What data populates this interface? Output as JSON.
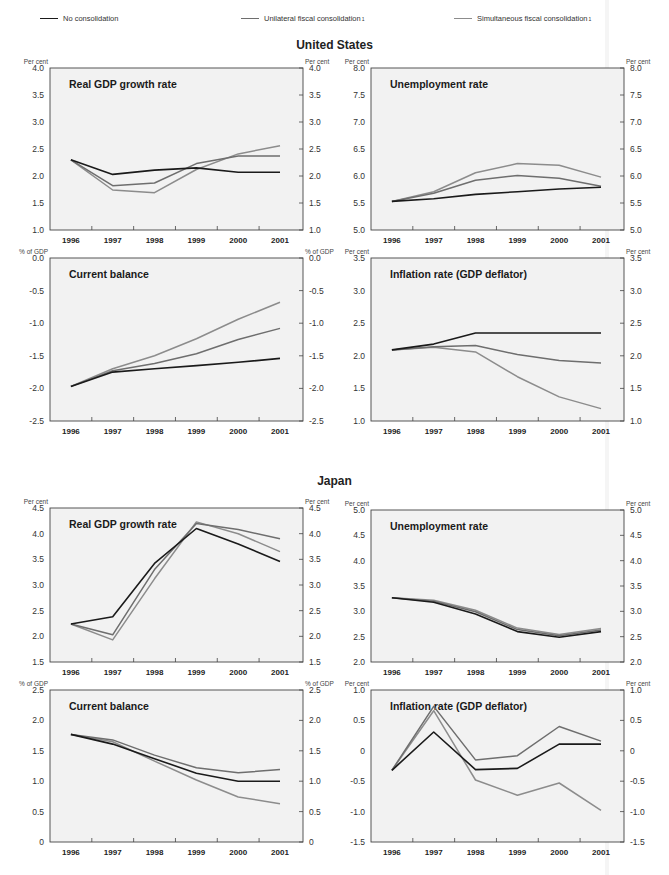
{
  "legend": {
    "items": [
      {
        "label": "No consolidation",
        "note": "",
        "color": "#1a1a1a"
      },
      {
        "label": "Unilateral fiscal consolidation",
        "note": "1",
        "color": "#6e6e6e"
      },
      {
        "label": "Simultaneous fiscal consolidation",
        "note": "1",
        "color": "#8c8c8c"
      }
    ]
  },
  "sections": [
    {
      "title": "United States"
    },
    {
      "title": "Japan"
    }
  ],
  "colors": {
    "plot_background": "#f2f2f2",
    "axis": "#444444",
    "no_consolidation": "#1a1a1a",
    "unilateral": "#6e6e6e",
    "simultaneous": "#8c8c8c"
  },
  "chart_data": [
    {
      "id": "us-gdp",
      "section": "United States",
      "type": "line",
      "title": "Real GDP growth rate",
      "ylabel_left": "Per cent",
      "ylabel_right": "Per cent",
      "categories": [
        "1996",
        "1997",
        "1998",
        "1999",
        "2000",
        "2001"
      ],
      "ylim": [
        1.0,
        4.0
      ],
      "yticks": [
        "1.0",
        "1.5",
        "2.0",
        "2.5",
        "3.0",
        "3.5",
        "4.0"
      ],
      "ytick_values": [
        1.0,
        1.5,
        2.0,
        2.5,
        3.0,
        3.5,
        4.0
      ],
      "grid": false,
      "series": [
        {
          "name": "No consolidation",
          "values": [
            2.3,
            2.03,
            2.11,
            2.15,
            2.07,
            2.07
          ]
        },
        {
          "name": "Unilateral fiscal consolidation",
          "values": [
            2.3,
            1.82,
            1.87,
            2.23,
            2.37,
            2.37
          ]
        },
        {
          "name": "Simultaneous fiscal consolidation",
          "values": [
            2.3,
            1.74,
            1.69,
            2.12,
            2.41,
            2.56
          ]
        }
      ]
    },
    {
      "id": "us-unemployment",
      "section": "United States",
      "type": "line",
      "title": "Unemployment rate",
      "ylabel_left": "Per cent",
      "ylabel_right": "Per cent",
      "categories": [
        "1996",
        "1997",
        "1998",
        "1999",
        "2000",
        "2001"
      ],
      "ylim": [
        5.0,
        8.0
      ],
      "yticks": [
        "5.0",
        "5.5",
        "6.0",
        "6.5",
        "7.0",
        "7.5",
        "8.0"
      ],
      "ytick_values": [
        5.0,
        5.5,
        6.0,
        6.5,
        7.0,
        7.5,
        8.0
      ],
      "grid": false,
      "series": [
        {
          "name": "No consolidation",
          "values": [
            5.53,
            5.58,
            5.66,
            5.71,
            5.76,
            5.79
          ]
        },
        {
          "name": "Unilateral fiscal consolidation",
          "values": [
            5.53,
            5.68,
            5.92,
            6.01,
            5.96,
            5.81
          ]
        },
        {
          "name": "Simultaneous fiscal consolidation",
          "values": [
            5.53,
            5.71,
            6.06,
            6.23,
            6.2,
            5.98
          ]
        }
      ]
    },
    {
      "id": "us-current-balance",
      "section": "United States",
      "type": "line",
      "title": "Current balance",
      "ylabel_left": "% of GDP",
      "ylabel_right": "% of GDP",
      "categories": [
        "1996",
        "1997",
        "1998",
        "1999",
        "2000",
        "2001"
      ],
      "ylim": [
        -2.5,
        0.0
      ],
      "yticks": [
        "-2.5",
        "-2.0",
        "-1.5",
        "-1.0",
        "-0.5",
        "0.0"
      ],
      "ytick_values": [
        -2.5,
        -2.0,
        -1.5,
        -1.0,
        -0.5,
        0.0
      ],
      "grid": false,
      "series": [
        {
          "name": "No consolidation",
          "values": [
            -1.97,
            -1.75,
            -1.7,
            -1.65,
            -1.6,
            -1.54
          ]
        },
        {
          "name": "Unilateral fiscal consolidation",
          "values": [
            -1.97,
            -1.73,
            -1.62,
            -1.47,
            -1.25,
            -1.08
          ]
        },
        {
          "name": "Simultaneous fiscal consolidation",
          "values": [
            -1.97,
            -1.7,
            -1.5,
            -1.24,
            -0.94,
            -0.68
          ]
        }
      ]
    },
    {
      "id": "us-inflation",
      "section": "United States",
      "type": "line",
      "title": "Inflation rate (GDP deflator)",
      "ylabel_left": "Per cent",
      "ylabel_right": "Per cent",
      "categories": [
        "1996",
        "1997",
        "1998",
        "1999",
        "2000",
        "2001"
      ],
      "ylim": [
        1.0,
        3.5
      ],
      "yticks": [
        "1.0",
        "1.5",
        "2.0",
        "2.5",
        "3.0",
        "3.5"
      ],
      "ytick_values": [
        1.0,
        1.5,
        2.0,
        2.5,
        3.0,
        3.5
      ],
      "grid": false,
      "series": [
        {
          "name": "No consolidation",
          "values": [
            2.09,
            2.18,
            2.35,
            2.35,
            2.35,
            2.35
          ]
        },
        {
          "name": "Unilateral fiscal consolidation",
          "values": [
            2.09,
            2.14,
            2.16,
            2.02,
            1.93,
            1.89
          ]
        },
        {
          "name": "Simultaneous fiscal consolidation",
          "values": [
            2.09,
            2.13,
            2.06,
            1.68,
            1.37,
            1.19
          ]
        }
      ]
    },
    {
      "id": "jp-gdp",
      "section": "Japan",
      "type": "line",
      "title": "Real GDP growth rate",
      "ylabel_left": "Per cent",
      "ylabel_right": "Per cent",
      "categories": [
        "1996",
        "1997",
        "1998",
        "1999",
        "2000",
        "2001"
      ],
      "ylim": [
        1.5,
        4.5
      ],
      "yticks": [
        "1.5",
        "2.0",
        "2.5",
        "3.0",
        "3.5",
        "4.0",
        "4.5"
      ],
      "ytick_values": [
        1.5,
        2.0,
        2.5,
        3.0,
        3.5,
        4.0,
        4.5
      ],
      "grid": false,
      "series": [
        {
          "name": "No consolidation",
          "values": [
            2.24,
            2.38,
            3.42,
            4.1,
            3.8,
            3.46
          ]
        },
        {
          "name": "Unilateral fiscal consolidation",
          "values": [
            2.24,
            2.03,
            3.3,
            4.2,
            4.08,
            3.9
          ]
        },
        {
          "name": "Simultaneous fiscal consolidation",
          "values": [
            2.24,
            1.93,
            3.12,
            4.23,
            4.0,
            3.65
          ]
        }
      ]
    },
    {
      "id": "jp-unemployment",
      "section": "Japan",
      "type": "line",
      "title": "Unemployment rate",
      "ylabel_left": "Per cent",
      "ylabel_right": "Per cent",
      "categories": [
        "1996",
        "1997",
        "1998",
        "1999",
        "2000",
        "2001"
      ],
      "ylim": [
        2.0,
        5.0
      ],
      "yticks": [
        "2.0",
        "2.5",
        "3.0",
        "3.5",
        "4.0",
        "4.5",
        "5.0"
      ],
      "ytick_values": [
        2.0,
        2.5,
        3.0,
        3.5,
        4.0,
        4.5,
        5.0
      ],
      "grid": false,
      "series": [
        {
          "name": "No consolidation",
          "values": [
            3.27,
            3.18,
            2.95,
            2.6,
            2.49,
            2.6
          ]
        },
        {
          "name": "Unilateral fiscal consolidation",
          "values": [
            3.27,
            3.2,
            2.99,
            2.64,
            2.52,
            2.63
          ]
        },
        {
          "name": "Simultaneous fiscal consolidation",
          "values": [
            3.27,
            3.22,
            3.02,
            2.67,
            2.54,
            2.66
          ]
        }
      ]
    },
    {
      "id": "jp-current-balance",
      "section": "Japan",
      "type": "line",
      "title": "Current balance",
      "ylabel_left": "% of GDP",
      "ylabel_right": "% of GDP",
      "categories": [
        "1996",
        "1997",
        "1998",
        "1999",
        "2000",
        "2001"
      ],
      "ylim": [
        0,
        2.5
      ],
      "yticks": [
        "0",
        "0.5",
        "1.0",
        "1.5",
        "2.0",
        "2.5"
      ],
      "ytick_values": [
        0,
        0.5,
        1.0,
        1.5,
        2.0,
        2.5
      ],
      "grid": false,
      "series": [
        {
          "name": "No consolidation",
          "values": [
            1.77,
            1.61,
            1.37,
            1.13,
            1.0,
            1.0
          ]
        },
        {
          "name": "Unilateral fiscal consolidation",
          "values": [
            1.77,
            1.68,
            1.43,
            1.22,
            1.14,
            1.19
          ]
        },
        {
          "name": "Simultaneous fiscal consolidation",
          "values": [
            1.77,
            1.65,
            1.33,
            1.02,
            0.74,
            0.63
          ]
        }
      ]
    },
    {
      "id": "jp-inflation",
      "section": "Japan",
      "type": "line",
      "title": "Inflation rate (GDP deflator)",
      "ylabel_left": "Per cent",
      "ylabel_right": "Per cent",
      "categories": [
        "1996",
        "1997",
        "1998",
        "1999",
        "2000",
        "2001"
      ],
      "ylim": [
        -1.5,
        1.0
      ],
      "yticks": [
        "-1.5",
        "-1.0",
        "-0.5",
        "0",
        "0.5",
        "1.0"
      ],
      "ytick_values": [
        -1.5,
        -1.0,
        -0.5,
        0,
        0.5,
        1.0
      ],
      "grid": false,
      "series": [
        {
          "name": "No consolidation",
          "values": [
            -0.32,
            0.31,
            -0.31,
            -0.29,
            0.11,
            0.11
          ]
        },
        {
          "name": "Unilateral fiscal consolidation",
          "values": [
            -0.32,
            0.73,
            -0.15,
            -0.08,
            0.4,
            0.16
          ]
        },
        {
          "name": "Simultaneous fiscal consolidation",
          "values": [
            -0.32,
            0.66,
            -0.48,
            -0.73,
            -0.53,
            -0.98
          ]
        }
      ]
    }
  ]
}
